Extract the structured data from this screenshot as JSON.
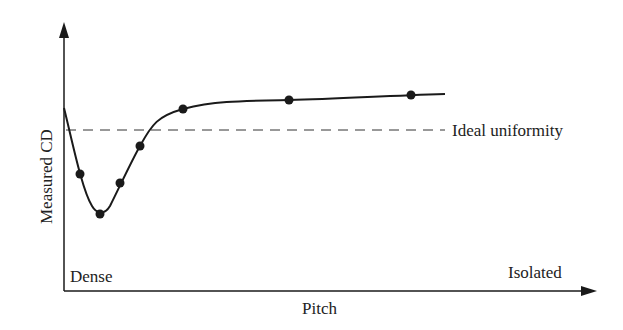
{
  "chart_data": {
    "type": "line",
    "title": "",
    "xlabel": "Pitch",
    "ylabel": "Measured CD",
    "x_start_label": "Dense",
    "x_end_label": "Isolated",
    "reference_line": {
      "label": "Ideal uniformity",
      "style": "dashed",
      "y_px": 130
    },
    "grid": false,
    "legend": null,
    "note": "Qualitative sketch; no numeric ticks. Points given in pixel coordinates (x right, y down).",
    "points_px": [
      [
        80,
        174
      ],
      [
        100,
        214
      ],
      [
        120,
        183
      ],
      [
        140,
        146
      ],
      [
        183,
        109
      ],
      [
        289,
        100
      ],
      [
        411,
        95
      ]
    ],
    "curve_px": "M64,108 C72,140 82,190 92,206 C96,213 104,216 110,206 C120,186 132,160 140,146 C152,124 158,116 183,109 C215,101 240,101 289,100 C340,99 380,96 445,94"
  },
  "colors": {
    "line": "#1a1a1a",
    "axis": "#1a1a1a",
    "dashed": "#333333"
  }
}
